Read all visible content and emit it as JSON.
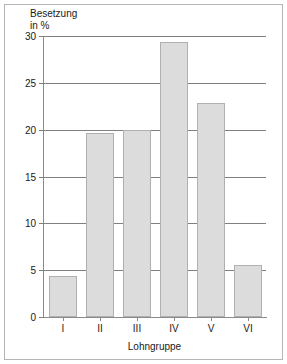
{
  "chart_data": {
    "type": "bar",
    "title": "",
    "ylabel": "Besetzung\nin %",
    "xlabel": "Lohngruppe",
    "categories": [
      "I",
      "II",
      "III",
      "IV",
      "V",
      "VI"
    ],
    "values": [
      4.4,
      19.6,
      20.0,
      29.4,
      22.8,
      5.5
    ],
    "ylim": [
      0,
      30
    ],
    "yticks": [
      0,
      5,
      10,
      15,
      20,
      25,
      30
    ],
    "ytick_labels": [
      "0",
      "5",
      "10",
      "15",
      "20",
      "25",
      "30"
    ],
    "grid": true,
    "legend": false,
    "bar_color": "#dcdcdc",
    "bar_edge_color": "#b0b0b0",
    "grid_color": "#808080",
    "axis_color": "#8a8a8a",
    "frame_color": "#b5b5b5",
    "text_color": "#1a1a1a"
  }
}
